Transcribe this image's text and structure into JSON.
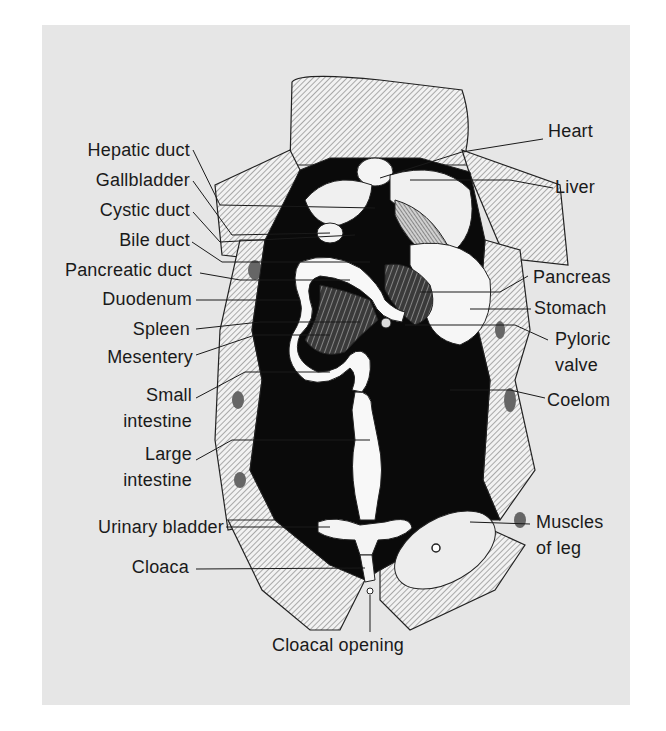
{
  "figure": {
    "colors": {
      "panel_background": "#e6e6e6",
      "body_cavity": "#0a0a0a",
      "organ_fill": "#ffffff",
      "skin_shading": "#9a9a9a",
      "label_text": "#1a1a1a"
    }
  },
  "labels_left": [
    {
      "id": "hepatic-duct",
      "text": "Hepatic duct"
    },
    {
      "id": "gallbladder",
      "text": "Gallbladder"
    },
    {
      "id": "cystic-duct",
      "text": "Cystic duct"
    },
    {
      "id": "bile-duct",
      "text": "Bile duct"
    },
    {
      "id": "pancreatic-duct",
      "text": "Pancreatic duct"
    },
    {
      "id": "duodenum",
      "text": "Duodenum"
    },
    {
      "id": "spleen",
      "text": "Spleen"
    },
    {
      "id": "mesentery",
      "text": "Mesentery"
    },
    {
      "id": "small-intestine",
      "line1": "Small",
      "line2": "intestine"
    },
    {
      "id": "large-intestine",
      "line1": "Large",
      "line2": "intestine"
    },
    {
      "id": "urinary-bladder",
      "text": "Urinary bladder"
    },
    {
      "id": "cloaca",
      "text": "Cloaca"
    }
  ],
  "labels_right": [
    {
      "id": "heart",
      "text": "Heart"
    },
    {
      "id": "liver",
      "text": "Liver"
    },
    {
      "id": "pancreas",
      "text": "Pancreas"
    },
    {
      "id": "stomach",
      "text": "Stomach"
    },
    {
      "id": "pyloric-valve",
      "line1": "Pyloric",
      "line2": "valve"
    },
    {
      "id": "coelom",
      "text": "Coelom"
    },
    {
      "id": "muscles-of-leg",
      "line1": "Muscles",
      "line2": "of leg"
    }
  ],
  "labels_bottom": [
    {
      "id": "cloacal-opening",
      "text": "Cloacal opening"
    }
  ]
}
